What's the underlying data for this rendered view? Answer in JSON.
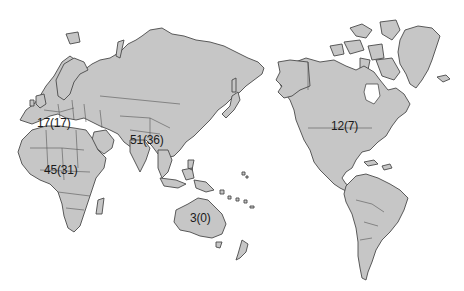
{
  "map": {
    "projection": "Pacific-centered world map",
    "colors": {
      "land": "#c6c6c6",
      "outline": "#4a4a4a",
      "background": "#ffffff",
      "label": "#1a1a1a"
    },
    "labels": [
      {
        "id": "europe",
        "text": "17(17)",
        "x": 37,
        "y": 117
      },
      {
        "id": "africa",
        "text": "45(31)",
        "x": 44,
        "y": 164
      },
      {
        "id": "asia",
        "text": "51(36)",
        "x": 130,
        "y": 134
      },
      {
        "id": "australia",
        "text": "3(0)",
        "x": 190,
        "y": 212
      },
      {
        "id": "north-america",
        "text": "12(7)",
        "x": 331,
        "y": 120
      }
    ]
  }
}
